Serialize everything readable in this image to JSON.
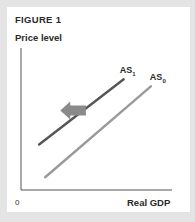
{
  "figure": {
    "title": "FIGURE 1",
    "y_axis_label": "Price level",
    "x_axis_label": "Real GDP",
    "origin_label": "0"
  },
  "colors": {
    "background": "#e4e4e4",
    "panel": "#ffffff",
    "axis": "#555555",
    "as1_line": "#555555",
    "as0_line": "#9a9a9a",
    "arrow": "#8a8a8a"
  },
  "chart_data": {
    "type": "line",
    "title": "FIGURE 1",
    "xlabel": "Real GDP",
    "ylabel": "Price level",
    "origin": "0",
    "series": [
      {
        "name": "AS1",
        "label_main": "AS",
        "label_sub": "1",
        "points": [
          [
            0.12,
            0.32
          ],
          [
            0.68,
            0.78
          ]
        ]
      },
      {
        "name": "AS0",
        "label_main": "AS",
        "label_sub": "0",
        "points": [
          [
            0.16,
            0.09
          ],
          [
            0.86,
            0.73
          ]
        ]
      }
    ],
    "annotations": [
      {
        "type": "arrow",
        "direction": "left",
        "meaning": "shift from AS0 to AS1",
        "from": [
          0.43,
          0.56
        ],
        "to": [
          0.26,
          0.56
        ]
      }
    ],
    "xlim": [
      0,
      1
    ],
    "ylim": [
      0,
      1
    ],
    "grid": false
  }
}
